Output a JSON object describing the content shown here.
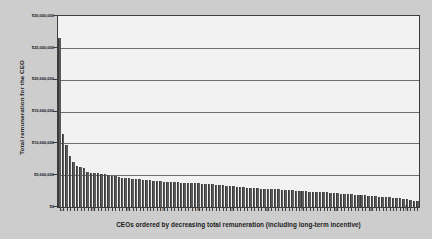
{
  "chart_data": {
    "type": "bar",
    "title": "",
    "xlabel": "CEOs ordered by decreasing total remuneration (including long-term incentive)",
    "ylabel": "Total remuneration for the CEO",
    "ylim": [
      0,
      30000000
    ],
    "ytick_labels": [
      "$30,000,000",
      "$25,000,000",
      "$20,000,000",
      "$15,000,000",
      "$10,000,000",
      "$5,000,000",
      "$0"
    ],
    "ytick_values": [
      30000000,
      25000000,
      20000000,
      15000000,
      10000000,
      5000000,
      0
    ],
    "grid": true,
    "legend": null,
    "xtick_labels": [
      "1",
      "10",
      "20",
      "30",
      "40",
      "50",
      "60",
      "70",
      "80",
      "90",
      "100"
    ],
    "xtick_positions": [
      1,
      10,
      20,
      30,
      40,
      50,
      60,
      70,
      80,
      90,
      100
    ],
    "categories": [
      1,
      2,
      3,
      4,
      5,
      6,
      7,
      8,
      9,
      10,
      11,
      12,
      13,
      14,
      15,
      16,
      17,
      18,
      19,
      20,
      21,
      22,
      23,
      24,
      25,
      26,
      27,
      28,
      29,
      30,
      31,
      32,
      33,
      34,
      35,
      36,
      37,
      38,
      39,
      40,
      41,
      42,
      43,
      44,
      45,
      46,
      47,
      48,
      49,
      50,
      51,
      52,
      53,
      54,
      55,
      56,
      57,
      58,
      59,
      60,
      61,
      62,
      63,
      64,
      65,
      66,
      67,
      68,
      69,
      70,
      71,
      72,
      73,
      74,
      75,
      76,
      77,
      78,
      79,
      80,
      81,
      82,
      83,
      84,
      85,
      86,
      87,
      88,
      89,
      90,
      91,
      92,
      93,
      94,
      95,
      96,
      97,
      98,
      99,
      100,
      101,
      102,
      103,
      104
    ],
    "values": [
      26500000,
      11500000,
      9800000,
      8000000,
      7000000,
      6500000,
      6350000,
      6100000,
      5500000,
      5400000,
      5350000,
      5300000,
      5200000,
      5150000,
      5100000,
      4900000,
      4800000,
      4700000,
      4600000,
      4550000,
      4500000,
      4450000,
      4400000,
      4350000,
      4300000,
      4250000,
      4200000,
      4150000,
      4100000,
      4050000,
      4000000,
      3980000,
      3950000,
      3900000,
      3880000,
      3850000,
      3820000,
      3800000,
      3780000,
      3750000,
      3700000,
      3680000,
      3650000,
      3600000,
      3550000,
      3500000,
      3450000,
      3400000,
      3350000,
      3300000,
      3250000,
      3200000,
      3150000,
      3100000,
      3050000,
      3000000,
      2980000,
      2950000,
      2900000,
      2880000,
      2850000,
      2820000,
      2800000,
      2780000,
      2750000,
      2700000,
      2650000,
      2600000,
      2550000,
      2500000,
      2480000,
      2450000,
      2420000,
      2400000,
      2380000,
      2350000,
      2300000,
      2280000,
      2250000,
      2200000,
      2150000,
      2100000,
      2050000,
      2000000,
      1980000,
      1950000,
      1900000,
      1880000,
      1850000,
      1800000,
      1750000,
      1700000,
      1650000,
      1600000,
      1550000,
      1500000,
      1450000,
      1400000,
      1350000,
      1300000,
      1200000,
      1100000,
      1000000,
      950000
    ],
    "bar_color": "#5a5a5a",
    "plot_background": "#f2f2f2",
    "page_background": "#cdcdcd",
    "gridline_color": "#6e6e6e",
    "axis_color": "#3c3c3c"
  }
}
